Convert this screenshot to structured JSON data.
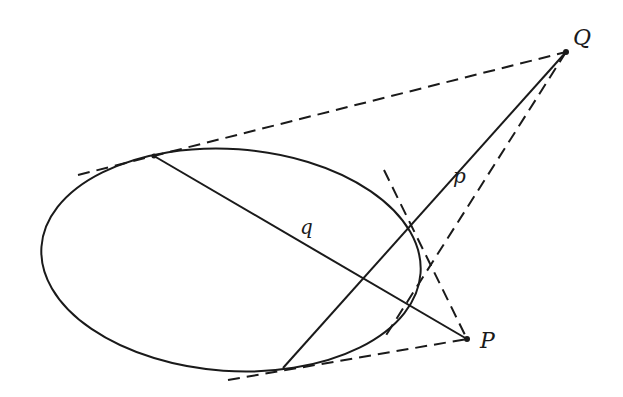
{
  "diagram": {
    "type": "conic-pole-polar",
    "colors": {
      "stroke": "#1a1a1a",
      "background": "#ffffff"
    },
    "ellipse": {
      "cx": 231,
      "cy": 260,
      "rx": 190,
      "ry": 111,
      "rotate": 4
    },
    "points": {
      "P": {
        "label": "P",
        "x": 467,
        "y": 339
      },
      "Q": {
        "label": "Q",
        "x": 566,
        "y": 52
      }
    },
    "tangent_points": {
      "T1": {
        "x": 154,
        "y": 156
      },
      "T2": {
        "x": 283,
        "y": 368
      },
      "T3": {
        "x": 410,
        "y": 228
      },
      "T4": {
        "x": 407,
        "y": 302
      }
    },
    "lines": {
      "p": {
        "label": "p",
        "label_x": 455,
        "label_y": 180
      },
      "q": {
        "label": "q",
        "label_x": 302,
        "label_y": 233
      }
    }
  }
}
